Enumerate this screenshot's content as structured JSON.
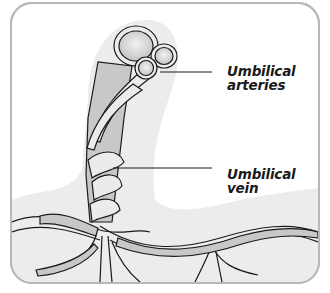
{
  "diagram": {
    "labels": [
      {
        "id": "arteries",
        "line1": "Umbilical",
        "line2": "arteries"
      },
      {
        "id": "vein",
        "line1": "Umbilical",
        "line2": "vein"
      }
    ]
  },
  "colors": {
    "frame_border": "#b8b8b8",
    "background_tissue": "#ececec",
    "vessel_fill": "#c8c8c8",
    "vessel_light": "#ebebeb",
    "outline": "#1a1a1a"
  }
}
